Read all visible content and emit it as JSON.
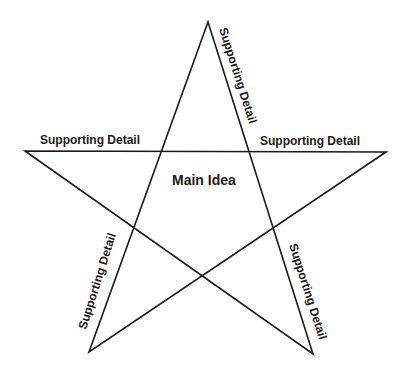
{
  "diagram": {
    "type": "star-graphic-organizer",
    "center_label": "Main Idea",
    "points": [
      {
        "id": "top-right-edge",
        "label": "Supporting Detail"
      },
      {
        "id": "left-arm",
        "label": "Supporting Detail"
      },
      {
        "id": "right-arm",
        "label": "Supporting Detail"
      },
      {
        "id": "bottom-left-edge",
        "label": "Supporting Detail"
      },
      {
        "id": "bottom-right-edge",
        "label": "Supporting Detail"
      }
    ],
    "colors": {
      "line": "#1a1a1a",
      "background": "#ffffff"
    }
  }
}
